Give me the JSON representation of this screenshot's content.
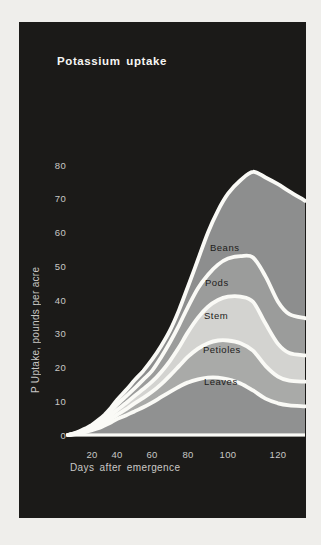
{
  "page": {
    "background_color": "#efeeeb"
  },
  "panel": {
    "background_color": "#1b1a18"
  },
  "chart_data": {
    "type": "area",
    "stacked": true,
    "title": "Potassium uptake",
    "xlabel": "Days after emergence",
    "ylabel": "P Uptake, pounds per acre",
    "xlim": [
      0,
      132
    ],
    "ylim": [
      0,
      80
    ],
    "x_ticks": [
      20,
      40,
      60,
      80,
      100,
      120
    ],
    "y_ticks": [
      0,
      10,
      20,
      30,
      40,
      50,
      60,
      70,
      80
    ],
    "grid": false,
    "legend": "inline-labels-on-bands",
    "values_are": "cumulative stack-top values, pounds per acre",
    "x_days": [
      0,
      5,
      10,
      15,
      20,
      25,
      30,
      35,
      40,
      45,
      50,
      55,
      60,
      65,
      70,
      75,
      80,
      85,
      90,
      95,
      100,
      105,
      110,
      115,
      120,
      125,
      132
    ],
    "series": [
      {
        "name": "Leaves",
        "color": "#909191",
        "cum": [
          0,
          0.2,
          0.5,
          0.9,
          1.4,
          2,
          2.8,
          3.7,
          4.7,
          5.8,
          7,
          8.2,
          9.6,
          11.2,
          12.8,
          14.3,
          15.6,
          16.5,
          17,
          17,
          16.5,
          15.3,
          13.2,
          10.8,
          9.4,
          8.8,
          8.5
        ]
      },
      {
        "name": "Petioles",
        "color": "#a9aaa8",
        "cum": [
          0,
          0.25,
          0.6,
          1.1,
          1.8,
          2.6,
          3.6,
          4.7,
          6,
          7.6,
          9.4,
          11,
          12.8,
          15,
          17.6,
          20.4,
          23.2,
          25.6,
          27.2,
          28,
          28,
          27.2,
          25,
          20.5,
          17.3,
          16.1,
          15.8
        ]
      },
      {
        "name": "Stem",
        "color": "#d3d3d0",
        "cum": [
          0,
          0.3,
          0.8,
          1.4,
          2.2,
          3.2,
          4.4,
          5.8,
          7.4,
          9.4,
          11.6,
          13.6,
          15.8,
          18.6,
          22,
          26,
          30.5,
          34.8,
          38,
          40,
          41,
          41,
          39.5,
          33,
          27,
          24.3,
          23.6
        ]
      },
      {
        "name": "Pods",
        "color": "#9b9c9b",
        "cum": [
          0,
          0.4,
          1,
          1.7,
          2.6,
          3.8,
          5.2,
          7,
          9,
          11.4,
          13.8,
          16.4,
          19,
          23,
          27.5,
          32.5,
          38,
          43.5,
          47.5,
          50.5,
          52.3,
          53,
          52.6,
          47,
          39.5,
          35.8,
          34.6
        ]
      },
      {
        "name": "Beans",
        "color": "#8d8e8e",
        "cum": [
          0,
          0.5,
          1.2,
          2,
          3,
          4.4,
          6,
          8,
          10.4,
          13.2,
          16.2,
          19,
          22.3,
          26.3,
          31,
          37,
          44,
          52,
          60,
          66.5,
          71.5,
          75.5,
          78,
          76.3,
          74.3,
          72.2,
          69.4
        ]
      }
    ],
    "separator_color": "#fafaf6",
    "axis_line_color": "#fafaf6",
    "tick_text_color": "#c9c8c5",
    "label_text_color": "#1d1d1b"
  }
}
